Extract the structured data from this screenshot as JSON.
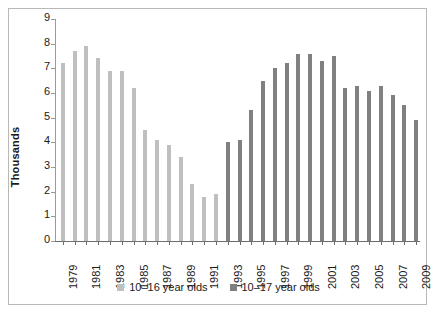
{
  "chart_data": {
    "type": "bar",
    "title": "",
    "xlabel": "",
    "ylabel": "Thousands",
    "ylim": [
      0,
      9
    ],
    "ytick_labels": [
      "9",
      "8",
      "7",
      "6",
      "5",
      "4",
      "3",
      "2",
      "1",
      "0"
    ],
    "ytick_values": [
      9,
      8,
      7,
      6,
      5,
      4,
      3,
      2,
      1,
      0
    ],
    "grid": false,
    "legend_position": "bottom-center",
    "categories": [
      "1979",
      "1980",
      "1981",
      "1982",
      "1983",
      "1984",
      "1985",
      "1986",
      "1987",
      "1988",
      "1989",
      "1990",
      "1991",
      "1992",
      "1993",
      "1994",
      "1995",
      "1996",
      "1997",
      "1998",
      "1999",
      "2000",
      "2001",
      "2002",
      "2003",
      "2004",
      "2005",
      "2006",
      "2007",
      "2008",
      "2009"
    ],
    "xtick_labels": [
      "1979",
      "1981",
      "1983",
      "1985",
      "1987",
      "1989",
      "1991",
      "1993",
      "1995",
      "1997",
      "1999",
      "2001",
      "2003",
      "2005",
      "2007",
      "2009"
    ],
    "series": [
      {
        "name": "10–16 year olds",
        "color": "#bfbfbf",
        "points": [
          {
            "x": "1979",
            "y": 7.2
          },
          {
            "x": "1980",
            "y": 7.7
          },
          {
            "x": "1981",
            "y": 7.9
          },
          {
            "x": "1982",
            "y": 7.4
          },
          {
            "x": "1983",
            "y": 6.9
          },
          {
            "x": "1984",
            "y": 6.9
          },
          {
            "x": "1985",
            "y": 6.2
          },
          {
            "x": "1986",
            "y": 4.5
          },
          {
            "x": "1987",
            "y": 4.1
          },
          {
            "x": "1988",
            "y": 3.9
          },
          {
            "x": "1989",
            "y": 3.4
          },
          {
            "x": "1990",
            "y": 2.3
          },
          {
            "x": "1991",
            "y": 1.8
          },
          {
            "x": "1992",
            "y": 1.9
          }
        ]
      },
      {
        "name": "10–17 year olds",
        "color": "#808080",
        "points": [
          {
            "x": "1993",
            "y": 4.0
          },
          {
            "x": "1994",
            "y": 4.1
          },
          {
            "x": "1995",
            "y": 5.3
          },
          {
            "x": "1996",
            "y": 6.5
          },
          {
            "x": "1997",
            "y": 7.0
          },
          {
            "x": "1998",
            "y": 7.2
          },
          {
            "x": "1999",
            "y": 7.6
          },
          {
            "x": "2000",
            "y": 7.6
          },
          {
            "x": "2001",
            "y": 7.3
          },
          {
            "x": "2002",
            "y": 7.5
          },
          {
            "x": "2003",
            "y": 6.2
          },
          {
            "x": "2004",
            "y": 6.3
          },
          {
            "x": "2005",
            "y": 6.1
          },
          {
            "x": "2006",
            "y": 6.3
          },
          {
            "x": "2007",
            "y": 5.9
          },
          {
            "x": "2008",
            "y": 5.5
          },
          {
            "x": "2009",
            "y": 4.9
          }
        ]
      }
    ],
    "legend": [
      {
        "label": "10–16 year olds",
        "color": "#bfbfbf"
      },
      {
        "label": "10–17 year olds",
        "color": "#808080"
      }
    ]
  }
}
